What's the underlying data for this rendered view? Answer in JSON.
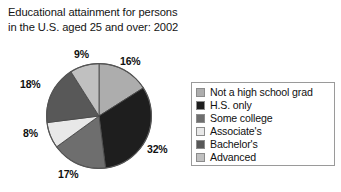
{
  "chart_data": {
    "type": "pie",
    "title": "Educational attainment for persons\nin the U.S. aged 25 and over: 2002",
    "xlabel": "",
    "ylabel": "",
    "legend_position": "right",
    "grid": false,
    "categories": [
      "Not a high school grad",
      "H.S. only",
      "Some college",
      "Associate's",
      "Bachelor's",
      "Advanced"
    ],
    "values": [
      16,
      32,
      17,
      8,
      18,
      9
    ],
    "value_labels": [
      "16%",
      "32%",
      "17%",
      "8%",
      "18%",
      "9%"
    ],
    "colors": [
      "#ADADAD",
      "#1E1E1E",
      "#6E6E6E",
      "#E8E8E8",
      "#585858",
      "#C0C0C0"
    ],
    "start_angle_deg": 0,
    "direction": "clockwise",
    "slices": [
      {
        "label": "Not a high school grad",
        "value": 16,
        "display": "16%",
        "color": "#ADADAD"
      },
      {
        "label": "H.S. only",
        "value": 32,
        "display": "32%",
        "color": "#1E1E1E"
      },
      {
        "label": "Some college",
        "value": 17,
        "display": "17%",
        "color": "#6E6E6E"
      },
      {
        "label": "Associate's",
        "value": 8,
        "display": "8%",
        "color": "#E8E8E8"
      },
      {
        "label": "Bachelor's",
        "value": 18,
        "display": "18%",
        "color": "#585858"
      },
      {
        "label": "Advanced",
        "value": 9,
        "display": "9%",
        "color": "#C0C0C0"
      }
    ]
  },
  "legend": {
    "items": [
      {
        "label": "Not a high school grad",
        "color": "#ADADAD"
      },
      {
        "label": "H.S. only",
        "color": "#1E1E1E"
      },
      {
        "label": "Some college",
        "color": "#6E6E6E"
      },
      {
        "label": "Associate's",
        "color": "#E8E8E8"
      },
      {
        "label": "Bachelor's",
        "color": "#585858"
      },
      {
        "label": "Advanced",
        "color": "#C0C0C0"
      }
    ]
  }
}
